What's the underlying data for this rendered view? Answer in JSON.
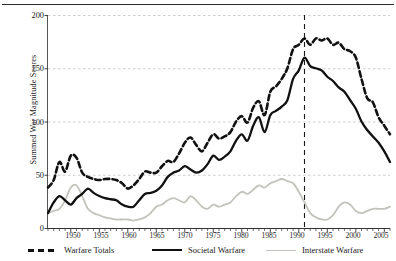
{
  "chart_data": {
    "type": "line",
    "title": "",
    "xlabel": "",
    "ylabel": "Summed War Magnitude Scores",
    "xlim": [
      1946,
      2006
    ],
    "ylim": [
      0,
      200
    ],
    "yticks": [
      0,
      50,
      100,
      150,
      200
    ],
    "xticks": [
      1950,
      1955,
      1960,
      1965,
      1970,
      1975,
      1980,
      1985,
      1990,
      1995,
      2000,
      2005
    ],
    "grid": true,
    "legend_position": "below",
    "annotations": [
      {
        "name": "end-of-cold-war-marker",
        "type": "vline",
        "x": 1991,
        "style": "dashed"
      }
    ],
    "x": [
      1946,
      1947,
      1948,
      1949,
      1950,
      1951,
      1952,
      1953,
      1954,
      1955,
      1956,
      1957,
      1958,
      1959,
      1960,
      1961,
      1962,
      1963,
      1964,
      1965,
      1966,
      1967,
      1968,
      1969,
      1970,
      1971,
      1972,
      1973,
      1974,
      1975,
      1976,
      1977,
      1978,
      1979,
      1980,
      1981,
      1982,
      1983,
      1984,
      1985,
      1986,
      1987,
      1988,
      1989,
      1990,
      1991,
      1992,
      1993,
      1994,
      1995,
      1996,
      1997,
      1998,
      1999,
      2000,
      2001,
      2002,
      2003,
      2004,
      2005,
      2006
    ],
    "series": [
      {
        "name": "Warfare Totals",
        "color": "#111111",
        "style": "dashed",
        "values": [
          38,
          45,
          60,
          53,
          68,
          66,
          55,
          47,
          46,
          44,
          45,
          46,
          45,
          44,
          42,
          38,
          40,
          47,
          55,
          53,
          52,
          58,
          63,
          62,
          72,
          88,
          77,
          70,
          72,
          84,
          78,
          82,
          85,
          95,
          107,
          110,
          116,
          118,
          109,
          108,
          126,
          127,
          131,
          127,
          136,
          144,
          152,
          148,
          151,
          163,
          169,
          174,
          177,
          175,
          170,
          174,
          178,
          175,
          169,
          164,
          159
        ]
      },
      {
        "name": "Societal Warfare",
        "color": "#111111",
        "style": "solid",
        "values": [
          13,
          24,
          27,
          25,
          21,
          26,
          25,
          36,
          34,
          27,
          26,
          27,
          25,
          20,
          17,
          18,
          25,
          30,
          29,
          27,
          24,
          23,
          25,
          26,
          30,
          34,
          33,
          34,
          30,
          32,
          33,
          35,
          40,
          44,
          50,
          55,
          56,
          57,
          52,
          50,
          57,
          58,
          60,
          58,
          62,
          66,
          70,
          69,
          72,
          79,
          82,
          86,
          90,
          88,
          86,
          89,
          92,
          91,
          89,
          87,
          85
        ]
      },
      {
        "name": "Interstate Warfare",
        "color": "#c3c3bd",
        "style": "solid-light",
        "values": [
          12,
          13,
          14,
          28,
          38,
          40,
          30,
          16,
          12,
          11,
          9,
          9,
          8,
          8,
          8,
          7,
          8,
          10,
          14,
          18,
          20,
          24,
          27,
          29,
          31,
          38,
          32,
          27,
          24,
          34,
          27,
          29,
          32,
          37,
          44,
          43,
          45,
          46,
          42,
          41,
          48,
          48,
          50,
          47,
          50,
          53,
          56,
          53,
          53,
          60,
          62,
          63,
          65,
          66,
          63,
          64,
          65,
          63,
          62,
          59,
          55
        ]
      }
    ],
    "series_pixel_paths": {
      "note": "pixel polylines sampled from the rendered figure, in plot coordinates (year, score)",
      "warfare_totals": [
        [
          1946,
          38
        ],
        [
          1947,
          45
        ],
        [
          1948,
          62
        ],
        [
          1949,
          53
        ],
        [
          1950,
          68
        ],
        [
          1951,
          66
        ],
        [
          1952,
          52
        ],
        [
          1953,
          48
        ],
        [
          1954,
          46
        ],
        [
          1955,
          45
        ],
        [
          1956,
          46
        ],
        [
          1957,
          46
        ],
        [
          1958,
          45
        ],
        [
          1959,
          42
        ],
        [
          1960,
          37
        ],
        [
          1961,
          40
        ],
        [
          1962,
          46
        ],
        [
          1963,
          53
        ],
        [
          1964,
          52
        ],
        [
          1965,
          52
        ],
        [
          1966,
          58
        ],
        [
          1967,
          63
        ],
        [
          1968,
          62
        ],
        [
          1969,
          70
        ],
        [
          1970,
          80
        ],
        [
          1971,
          85
        ],
        [
          1972,
          78
        ],
        [
          1973,
          72
        ],
        [
          1974,
          80
        ],
        [
          1975,
          88
        ],
        [
          1976,
          84
        ],
        [
          1977,
          86
        ],
        [
          1978,
          90
        ],
        [
          1979,
          100
        ],
        [
          1980,
          105
        ],
        [
          1981,
          99
        ],
        [
          1982,
          113
        ],
        [
          1983,
          119
        ],
        [
          1984,
          106
        ],
        [
          1985,
          128
        ],
        [
          1986,
          133
        ],
        [
          1987,
          140
        ],
        [
          1988,
          150
        ],
        [
          1989,
          168
        ],
        [
          1990,
          172
        ],
        [
          1991,
          178
        ],
        [
          1992,
          172
        ],
        [
          1993,
          178
        ],
        [
          1994,
          176
        ],
        [
          1995,
          178
        ],
        [
          1996,
          172
        ],
        [
          1997,
          174
        ],
        [
          1998,
          168
        ],
        [
          1999,
          166
        ],
        [
          2000,
          160
        ],
        [
          2001,
          140
        ],
        [
          2002,
          122
        ],
        [
          2003,
          118
        ],
        [
          2004,
          104
        ],
        [
          2005,
          96
        ],
        [
          2006,
          88
        ]
      ],
      "societal_warfare": [
        [
          1946,
          14
        ],
        [
          1947,
          24
        ],
        [
          1948,
          30
        ],
        [
          1949,
          26
        ],
        [
          1950,
          22
        ],
        [
          1951,
          28
        ],
        [
          1952,
          32
        ],
        [
          1953,
          37
        ],
        [
          1954,
          33
        ],
        [
          1955,
          30
        ],
        [
          1956,
          28
        ],
        [
          1957,
          27
        ],
        [
          1958,
          26
        ],
        [
          1959,
          22
        ],
        [
          1960,
          20
        ],
        [
          1961,
          20
        ],
        [
          1962,
          26
        ],
        [
          1963,
          32
        ],
        [
          1964,
          33
        ],
        [
          1965,
          35
        ],
        [
          1966,
          40
        ],
        [
          1967,
          48
        ],
        [
          1968,
          52
        ],
        [
          1969,
          54
        ],
        [
          1970,
          58
        ],
        [
          1971,
          55
        ],
        [
          1972,
          52
        ],
        [
          1973,
          54
        ],
        [
          1974,
          60
        ],
        [
          1975,
          68
        ],
        [
          1976,
          64
        ],
        [
          1977,
          67
        ],
        [
          1978,
          72
        ],
        [
          1979,
          82
        ],
        [
          1980,
          88
        ],
        [
          1981,
          82
        ],
        [
          1982,
          96
        ],
        [
          1983,
          104
        ],
        [
          1984,
          90
        ],
        [
          1985,
          106
        ],
        [
          1986,
          110
        ],
        [
          1987,
          114
        ],
        [
          1988,
          120
        ],
        [
          1989,
          140
        ],
        [
          1990,
          148
        ],
        [
          1991,
          160
        ],
        [
          1992,
          152
        ],
        [
          1993,
          150
        ],
        [
          1994,
          148
        ],
        [
          1995,
          142
        ],
        [
          1996,
          138
        ],
        [
          1997,
          132
        ],
        [
          1998,
          128
        ],
        [
          1999,
          120
        ],
        [
          2000,
          112
        ],
        [
          2001,
          100
        ],
        [
          2002,
          92
        ],
        [
          2003,
          86
        ],
        [
          2004,
          80
        ],
        [
          2005,
          72
        ],
        [
          2006,
          62
        ]
      ],
      "interstate_warfare": [
        [
          1946,
          14
        ],
        [
          1947,
          16
        ],
        [
          1948,
          18
        ],
        [
          1949,
          26
        ],
        [
          1950,
          38
        ],
        [
          1951,
          40
        ],
        [
          1952,
          30
        ],
        [
          1953,
          18
        ],
        [
          1954,
          14
        ],
        [
          1955,
          12
        ],
        [
          1956,
          10
        ],
        [
          1957,
          9
        ],
        [
          1958,
          8
        ],
        [
          1959,
          8
        ],
        [
          1960,
          8
        ],
        [
          1961,
          7
        ],
        [
          1962,
          8
        ],
        [
          1963,
          10
        ],
        [
          1964,
          14
        ],
        [
          1965,
          20
        ],
        [
          1966,
          22
        ],
        [
          1967,
          26
        ],
        [
          1968,
          28
        ],
        [
          1969,
          26
        ],
        [
          1970,
          24
        ],
        [
          1971,
          30
        ],
        [
          1972,
          26
        ],
        [
          1973,
          20
        ],
        [
          1974,
          18
        ],
        [
          1975,
          22
        ],
        [
          1976,
          20
        ],
        [
          1977,
          22
        ],
        [
          1978,
          24
        ],
        [
          1979,
          30
        ],
        [
          1980,
          34
        ],
        [
          1981,
          32
        ],
        [
          1982,
          36
        ],
        [
          1983,
          40
        ],
        [
          1984,
          38
        ],
        [
          1985,
          42
        ],
        [
          1986,
          44
        ],
        [
          1987,
          46
        ],
        [
          1988,
          44
        ],
        [
          1989,
          42
        ],
        [
          1990,
          34
        ],
        [
          1991,
          24
        ],
        [
          1992,
          14
        ],
        [
          1993,
          10
        ],
        [
          1994,
          8
        ],
        [
          1995,
          8
        ],
        [
          1996,
          12
        ],
        [
          1997,
          20
        ],
        [
          1998,
          24
        ],
        [
          1999,
          22
        ],
        [
          2000,
          16
        ],
        [
          2001,
          14
        ],
        [
          2002,
          16
        ],
        [
          2003,
          18
        ],
        [
          2004,
          18
        ],
        [
          2005,
          18
        ],
        [
          2006,
          20
        ]
      ]
    }
  },
  "axis": {
    "y_tick_labels": [
      "200",
      "150",
      "100",
      "50",
      "0"
    ],
    "y_axis_title": "Summed War Magnitude Scores",
    "x_tick_labels": [
      "1950",
      "1955",
      "1960",
      "1965",
      "1970",
      "1975",
      "1980",
      "1985",
      "1990",
      "1995",
      "2000",
      "2005"
    ]
  },
  "legend": {
    "items": [
      {
        "label": "Warfare Totals",
        "style": "dashed",
        "color": "#111111"
      },
      {
        "label": "Societal Warfare",
        "style": "solid",
        "color": "#111111"
      },
      {
        "label": "Interstate Warfare",
        "style": "solid-light",
        "color": "#c3c3bd"
      }
    ]
  }
}
